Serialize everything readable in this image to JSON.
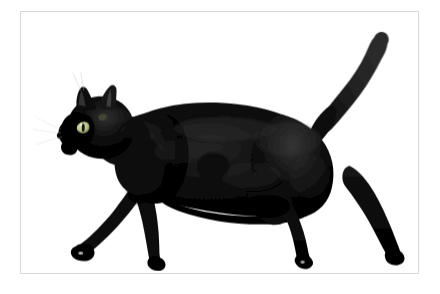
{
  "scene": {
    "subject": "black cat walking in profile, facing left",
    "background_color": "#ffffff",
    "frame_border_color": "#d8d8d8",
    "canvas_color": "#ffffff",
    "alt_text": "A black cat walking to the left, seen from the side, on a plain white background inside a thin grey picture frame."
  },
  "cat": {
    "fur_color": "#050505",
    "fur_highlight_color": "#2a2a2a",
    "fur_shadow_color": "#000000",
    "eye_color": "#b9c48b",
    "eye_pupil_color": "#1a1a08",
    "whisker_color": "#cfcfcf",
    "parts": [
      {
        "name": "head",
        "label": "Head"
      },
      {
        "name": "ear-front",
        "label": "Front ear"
      },
      {
        "name": "ear-back",
        "label": "Back ear"
      },
      {
        "name": "eye",
        "label": "Eye"
      },
      {
        "name": "muzzle",
        "label": "Muzzle"
      },
      {
        "name": "body",
        "label": "Body"
      },
      {
        "name": "tail",
        "label": "Tail"
      },
      {
        "name": "front-leg-extended",
        "label": "Extended front leg"
      },
      {
        "name": "front-leg-rear",
        "label": "Rear front leg"
      },
      {
        "name": "hind-leg-near",
        "label": "Near hind leg"
      },
      {
        "name": "hind-leg-far",
        "label": "Far hind leg"
      }
    ]
  },
  "geometry": {
    "frame": {
      "x": 20,
      "y": 11,
      "width": 399,
      "height": 263
    },
    "viewbox": {
      "width": 399,
      "height": 263
    }
  }
}
